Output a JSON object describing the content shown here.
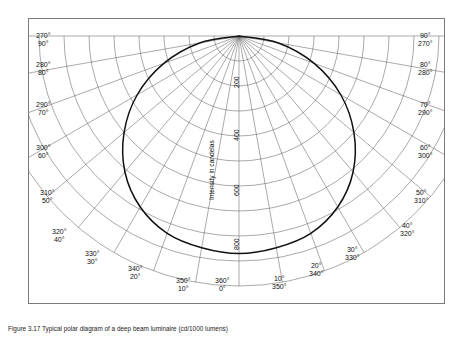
{
  "caption": "Figure 3.17 Typical polar diagram of a deep beam luminaire (cd/1000 lumens)",
  "chart_data": {
    "type": "line",
    "plot_kind": "polar-distribution",
    "title": "",
    "radial_axis_title": "Intensity in candelas",
    "radial_ticks": [
      200,
      400,
      600,
      800
    ],
    "radial_max": 1000,
    "angular_ticks_deg": [
      0,
      10,
      20,
      30,
      40,
      50,
      60,
      70,
      80,
      90,
      270,
      280,
      290,
      300,
      310,
      320,
      330,
      340,
      350,
      360
    ],
    "angle_step_deg": 10,
    "grid": true,
    "legend": "none",
    "angle_labels": [
      {
        "deg": 0,
        "left": "0°",
        "right": "360°"
      },
      {
        "deg": 10,
        "left": "10°",
        "right": "350°"
      },
      {
        "deg": 20,
        "left": "20°",
        "right": "340°"
      },
      {
        "deg": 30,
        "left": "30°",
        "right": "330°"
      },
      {
        "deg": 40,
        "left": "40°",
        "right": "320°"
      },
      {
        "deg": 50,
        "left": "50°",
        "right": "310°"
      },
      {
        "deg": 60,
        "left": "60°",
        "right": "300°"
      },
      {
        "deg": 70,
        "left": "70°",
        "right": "290°"
      },
      {
        "deg": 80,
        "left": "80°",
        "right": "280°"
      },
      {
        "deg": 90,
        "left": "90°",
        "right": "270°"
      }
    ],
    "series": [
      {
        "name": "Luminous intensity distribution",
        "angles_deg": [
          0,
          10,
          20,
          30,
          40,
          50,
          60,
          70,
          80,
          90
        ],
        "values_cd": [
          870,
          860,
          840,
          790,
          710,
          600,
          470,
          320,
          160,
          0
        ]
      }
    ]
  },
  "axis_labels": {
    "tick_200": "200",
    "tick_400": "400",
    "tick_600": "600",
    "tick_800": "800",
    "radial_title": "Intensity in candelas"
  },
  "left_labels": [
    {
      "top": "270°",
      "bottom": "90°"
    },
    {
      "top": "280°",
      "bottom": "80°"
    },
    {
      "top": "290°",
      "bottom": "70°"
    },
    {
      "top": "300°",
      "bottom": "60°"
    },
    {
      "top": "310°",
      "bottom": "50°"
    },
    {
      "top": "320°",
      "bottom": "40°"
    },
    {
      "top": "330°",
      "bottom": "30°"
    },
    {
      "top": "340°",
      "bottom": "20°"
    },
    {
      "top": "350°",
      "bottom": "10°"
    },
    {
      "top": "360°",
      "bottom": "0°"
    }
  ],
  "right_labels": [
    {
      "top": "90°",
      "bottom": "270°"
    },
    {
      "top": "80°",
      "bottom": "280°"
    },
    {
      "top": "70°",
      "bottom": "290°"
    },
    {
      "top": "60°",
      "bottom": "300°"
    },
    {
      "top": "50°",
      "bottom": "310°"
    },
    {
      "top": "40°",
      "bottom": "320°"
    },
    {
      "top": "30°",
      "bottom": "330°"
    },
    {
      "top": "20°",
      "bottom": "340°"
    },
    {
      "top": "10°",
      "bottom": "350°"
    }
  ],
  "colors": {
    "curve": "#111111",
    "grid": "#555555",
    "frame": "#7a7a7a",
    "background": "#ffffff"
  }
}
